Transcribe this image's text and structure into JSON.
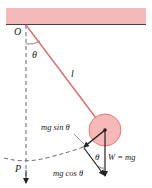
{
  "diagram": {
    "colors": {
      "ceiling": "#f4b9b9",
      "string": "#e06a6a",
      "bob_fill": "#f7b8b8",
      "bob_stroke": "#e07a7a",
      "ink": "#222222"
    },
    "labels": {
      "pivot": "O",
      "angle_top": "θ",
      "length": "l",
      "tangential_force": "mg sin θ",
      "angle_bottom": "θ",
      "weight": "W = mg",
      "radial_force": "mg cos θ",
      "equilibrium_point": "P"
    }
  }
}
